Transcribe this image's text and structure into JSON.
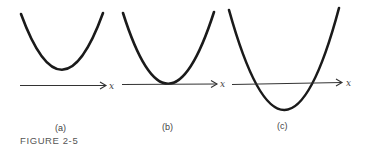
{
  "figure": {
    "caption": "FIGURE 2-5",
    "panels": [
      {
        "id": "a",
        "label": "(a)",
        "axis_label": "x",
        "description": "Parabola entirely above the x-axis (no real roots)"
      },
      {
        "id": "b",
        "label": "(b)",
        "axis_label": "x",
        "description": "Parabola tangent to the x-axis (one repeated root)"
      },
      {
        "id": "c",
        "label": "(c)",
        "axis_label": "x",
        "description": "Parabola crossing the x-axis (two real roots)"
      }
    ]
  },
  "colors": {
    "curve": "#1a1a1a",
    "axis": "#333333",
    "text": "#444444"
  }
}
